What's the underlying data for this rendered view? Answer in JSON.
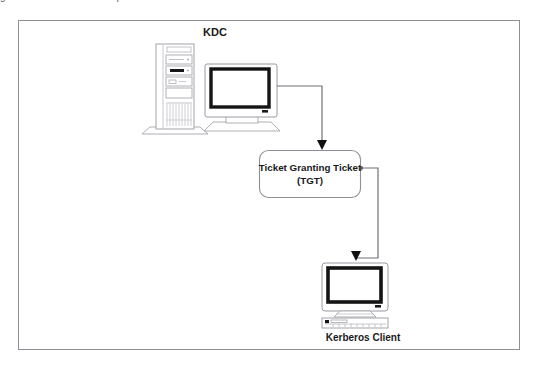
{
  "page": {
    "width": 541,
    "height": 365,
    "background": "#ffffff",
    "clipped_caption_above": "gure 2:  Kerberos  TGT  request"
  },
  "frame": {
    "name": "diagram-border",
    "x": 18,
    "y": 20,
    "width": 502,
    "height": 330,
    "stroke": "#8f8f97",
    "fill": "#ffffff"
  },
  "colors": {
    "line": "#6f6f78",
    "line_dark": "#2b2b2b",
    "arrow": "#111111",
    "screen_bezel": "#111111",
    "device_outline": "#9a9aa2",
    "device_fill": "#ffffff",
    "text": "#1a1a1a",
    "drive_led": "#111111"
  },
  "nodes": {
    "kdc": {
      "label": "KDC",
      "label_x": 215,
      "label_y": 35,
      "font_size": 11,
      "tower": {
        "x": 156,
        "y": 44,
        "width": 38,
        "height": 86
      },
      "monitor": {
        "x": 205,
        "y": 64,
        "width": 72,
        "height": 58
      }
    },
    "tgt": {
      "line1": "Ticket Granting Ticket",
      "line2": "(TGT)",
      "box": {
        "x": 259,
        "y": 150,
        "width": 102,
        "height": 48,
        "radius": 9
      },
      "font_size": 9.5
    },
    "client": {
      "label": "Kerberos Client",
      "label_x": 363,
      "label_y": 340,
      "font_size": 10,
      "monitor": {
        "x": 322,
        "y": 261,
        "width": 66,
        "height": 54
      },
      "keyboard": {
        "x": 322,
        "y": 316,
        "width": 66,
        "height": 11
      }
    }
  },
  "connectors": [
    {
      "name": "kdc-to-tgt",
      "from": "kdc-monitor",
      "to": "tgt-box",
      "points": "277,86 322,86 322,140",
      "arrow_at": {
        "x": 322,
        "y": 149
      }
    },
    {
      "name": "tgt-to-client",
      "from": "tgt-box",
      "to": "client-monitor",
      "points": "361,168 378,168 378,258 356,258 356,251",
      "arrow_at": {
        "x": 356,
        "y": 260
      },
      "source_dot": {
        "x": 361,
        "y": 168,
        "r": 2
      }
    }
  ]
}
